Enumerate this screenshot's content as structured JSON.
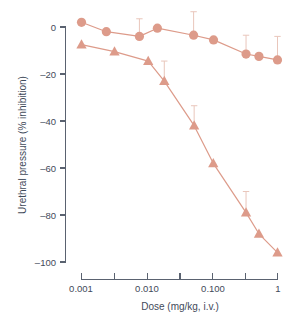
{
  "chart_data": {
    "type": "line",
    "title": "",
    "xlabel": "Dose (mg/kg, i.v.)",
    "ylabel": "Urethral pressure (% inhibition)",
    "xscale": "log",
    "xlim": [
      0.001,
      1
    ],
    "ylim": [
      -100,
      0
    ],
    "yticks": [
      0,
      -20,
      -40,
      -60,
      -80,
      -100
    ],
    "ytick_labels": [
      "0",
      "–20",
      "–40",
      "–60",
      "–80",
      "–100"
    ],
    "xticks": [
      0.001,
      0.003,
      0.01,
      0.03,
      0.1,
      0.3,
      1
    ],
    "xtick_labels": [
      "0.001",
      "",
      "0.010",
      "",
      "0.100",
      "",
      "1"
    ],
    "grid": false,
    "legend": "none",
    "series_color": "#dd9b8a",
    "error_color": "#e9c6bb",
    "axis_color": "#5a6270",
    "series": [
      {
        "name": "circles",
        "marker": "circle",
        "x": [
          0.001,
          0.0024,
          0.0077,
          0.0145,
          0.052,
          0.105,
          0.33,
          0.52,
          1.0
        ],
        "values": [
          2,
          -2,
          -4,
          -0.5,
          -3.5,
          -5.5,
          -11.5,
          -12.5,
          -14
        ],
        "errors_up": [
          0,
          0,
          7.5,
          0,
          10,
          0,
          8,
          0,
          10
        ],
        "errors_down": [
          0,
          0,
          0,
          0,
          0,
          0,
          0,
          0,
          0
        ]
      },
      {
        "name": "triangles",
        "marker": "triangle",
        "x": [
          0.001,
          0.0032,
          0.0105,
          0.0185,
          0.053,
          0.104,
          0.33,
          0.52,
          1.0
        ],
        "values": [
          -7.5,
          -10.5,
          -14.5,
          -23,
          -42,
          -58,
          -79,
          -88,
          -96
        ],
        "errors_up": [
          0,
          0,
          0,
          8.5,
          8.5,
          0,
          9,
          0,
          0
        ],
        "errors_down": [
          0,
          0,
          0,
          0,
          0,
          0,
          0,
          0,
          0
        ]
      }
    ]
  },
  "axes": {
    "y_title": "Urethral pressure (% inhibition)",
    "x_title": "Dose (mg/kg, i.v.)"
  }
}
